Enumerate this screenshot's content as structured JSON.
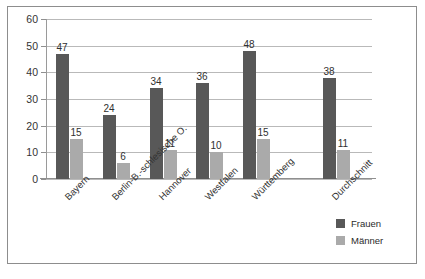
{
  "chart_data": {
    "type": "bar",
    "title": "",
    "subtitle": "",
    "xlabel": "",
    "ylabel": "",
    "ylim": [
      0,
      60
    ],
    "yticks": [
      0,
      10,
      20,
      30,
      40,
      50,
      60
    ],
    "grid": true,
    "legend_position": "bottom-right",
    "categories": [
      "Bayern",
      "Berlin-B.-schlesische O.",
      "Hannover",
      "Westfalen",
      "Württemberg",
      "Durchschnitt"
    ],
    "series": [
      {
        "name": "Frauen",
        "color": "#585858",
        "values": [
          47,
          24,
          34,
          36,
          48,
          38
        ]
      },
      {
        "name": "Männer",
        "color": "#aaaaaa",
        "values": [
          15,
          6,
          11,
          10,
          15,
          11
        ]
      }
    ]
  },
  "axis": {
    "y_tick_labels": [
      "0",
      "10",
      "20",
      "30",
      "40",
      "50",
      "60"
    ]
  },
  "legend": {
    "items": [
      {
        "label": "Frauen",
        "color": "#585858"
      },
      {
        "label": "Männer",
        "color": "#aaaaaa"
      }
    ]
  }
}
